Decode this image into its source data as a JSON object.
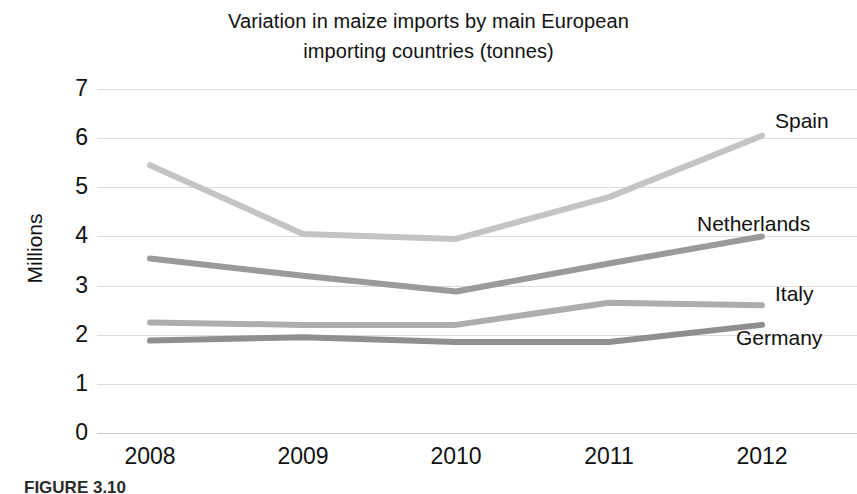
{
  "chart_data": {
    "type": "line",
    "title": "Variation in maize imports by main European importing countries (tonnes)",
    "title_lines": [
      "Variation in maize imports by main European",
      "importing countries (tonnes)"
    ],
    "xlabel": "",
    "ylabel": "Millions",
    "categories": [
      "2008",
      "2009",
      "2010",
      "2011",
      "2012"
    ],
    "x": [
      2008,
      2009,
      2010,
      2011,
      2012
    ],
    "ylim": [
      0,
      7
    ],
    "y_ticks": [
      "0",
      "1",
      "2",
      "3",
      "4",
      "5",
      "6",
      "7"
    ],
    "y_tick_values": [
      0,
      1,
      2,
      3,
      4,
      5,
      6,
      7
    ],
    "grid": true,
    "legend_position": "right-inline-end-labels",
    "series": [
      {
        "name": "Spain",
        "values": [
          5.45,
          4.05,
          3.95,
          4.8,
          6.05
        ],
        "color": "#c4c4c4",
        "label_x": 775,
        "label_y": 110
      },
      {
        "name": "Netherlands",
        "values": [
          3.55,
          3.2,
          2.88,
          3.45,
          4.0
        ],
        "color": "#9a9a9a",
        "label_x": 697,
        "label_y": 213
      },
      {
        "name": "Italy",
        "values": [
          2.25,
          2.2,
          2.2,
          2.65,
          2.6
        ],
        "color": "#adadad",
        "label_x": 775,
        "label_y": 283
      },
      {
        "name": "Germany",
        "values": [
          1.88,
          1.95,
          1.85,
          1.85,
          2.2
        ],
        "color": "#8f8f8f",
        "label_x": 736,
        "label_y": 327
      }
    ]
  },
  "caption": {
    "text": "FIGURE 3.10"
  }
}
